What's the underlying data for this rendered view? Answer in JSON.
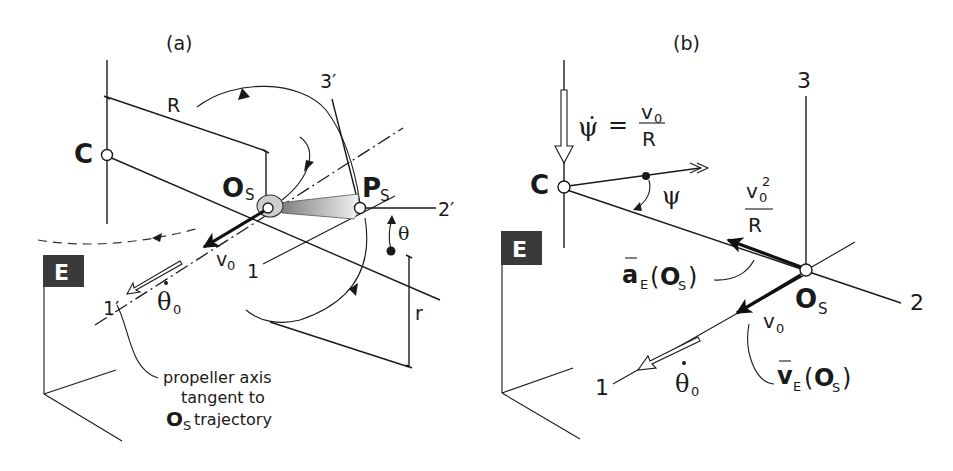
{
  "figure": {
    "panels": [
      {
        "id": "a",
        "label": "(a)",
        "frame_badge": "E",
        "points": {
          "center": "C",
          "hub": "O",
          "hub_sub": "S",
          "blade_tip": "P",
          "blade_tip_sub": "S"
        },
        "axes": {
          "axis_1": "1",
          "axis_1_prime": "1′",
          "axis_2_prime": "2′",
          "axis_3_prime": "3′"
        },
        "dimensions": {
          "R": "R",
          "r": "r"
        },
        "angle": "θ",
        "velocity": {
          "symbol": "v",
          "sub": "0"
        },
        "spin_rate": {
          "symbol": "θ̇",
          "base": "θ",
          "sub": "0"
        },
        "annotation": {
          "line1": "propeller axis",
          "line2": "tangent to",
          "line3_bold": "O",
          "line3_sub": "S",
          "line3_rest": "trajectory"
        }
      },
      {
        "id": "b",
        "label": "(b)",
        "frame_badge": "E",
        "points": {
          "center": "C",
          "hub": "O",
          "hub_sub": "S"
        },
        "axes": {
          "axis_1": "1",
          "axis_2": "2",
          "axis_3": "3"
        },
        "angle": "ψ",
        "yaw_rate": {
          "lhs": "ψ̇",
          "eq": "=",
          "num": "v",
          "num_sub": "0",
          "den": "R"
        },
        "centripetal": {
          "num": "v",
          "num_sub": "0",
          "num_sup": "2",
          "den": "R"
        },
        "acceleration": {
          "symbol": "a",
          "sub": "E",
          "arg": "O",
          "arg_sub": "S"
        },
        "velocity_vec": {
          "symbol": "v",
          "sub": "E",
          "arg": "O",
          "arg_sub": "S"
        },
        "velocity": {
          "symbol": "v",
          "sub": "0"
        },
        "spin_rate": {
          "base": "θ",
          "sub": "0"
        }
      }
    ]
  },
  "colors": {
    "ink": "#1a1a1a",
    "badge_bg": "#3a3a3a",
    "badge_fg": "#ffffff",
    "blade_light": "#f2f2f2",
    "blade_dark": "#8a8a8a",
    "hub_fill": "#cfcfcf"
  }
}
